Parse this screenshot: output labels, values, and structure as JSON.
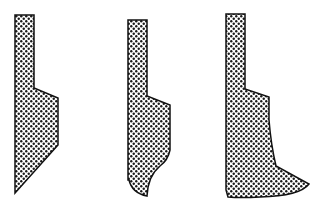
{
  "diagram": {
    "fill_pattern": "dot-checker",
    "colors": {
      "background": "#ffffff",
      "stroke": "#111111",
      "pattern_dark": "#1a1a1a",
      "pattern_light": "#ffffff"
    },
    "shapes": [
      {
        "id": "profile-1",
        "label": "",
        "path": "M15,15 L34,15 L34,88 L58,98 L58,145 L15,193 Z"
      },
      {
        "id": "profile-2",
        "label": "",
        "path": "M128,20 L147,20 L147,96 L170,105 L170,150 Q168,160 160,166 Q148,176 147,196 Q132,193 129,180 L128,180 Z"
      },
      {
        "id": "profile-3",
        "label": "",
        "path": "M226,14 L245,14 L245,89 L269,97 L269,120 Q271,145 276,166 L309,184 Q300,196 260,197 Q240,198 228,197 L226,190 Z"
      }
    ]
  }
}
